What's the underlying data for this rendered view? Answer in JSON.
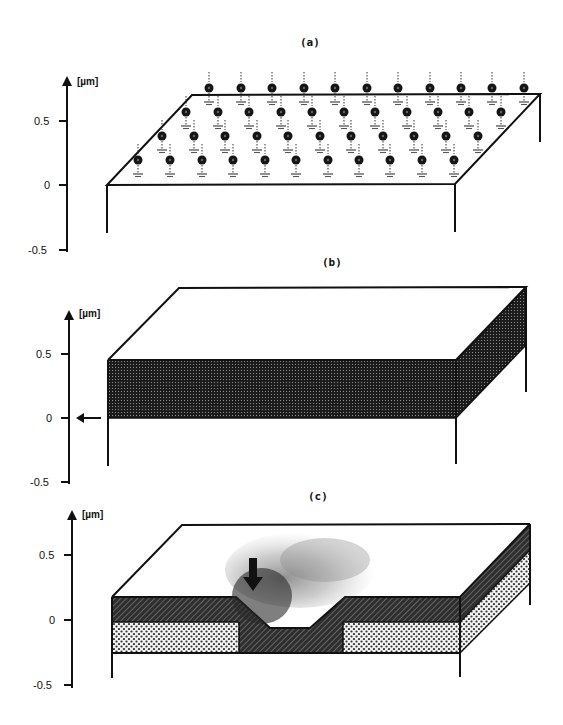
{
  "panels": [
    {
      "id": "a",
      "label": "(a)",
      "axis": {
        "unit": "[µm]",
        "ticks": [
          "0.5",
          "0",
          "-0.5"
        ]
      },
      "description": "Substrate surface with array of charged particles (dots) above dashed arrows toward ground-symbol charges on surface",
      "charge_rows": 4,
      "charges_per_row": 11
    },
    {
      "id": "b",
      "label": "(b)",
      "axis": {
        "unit": "[µm]",
        "ticks": [
          "0.5",
          "0",
          "-0.5"
        ]
      },
      "description": "Block with dark stippled layer from 0 to ~0.45 µm; arrow pointing at 0 level",
      "arrow": "left-arrow"
    },
    {
      "id": "c",
      "label": "(c)",
      "axis": {
        "unit": "[µm]",
        "ticks": [
          "0.5",
          "0",
          "-0.5"
        ]
      },
      "description": "Two-layer stack (hatched top, dotted bottom) with trapezoidal groove; downward arrow and particle spray at groove",
      "arrow": "down-arrow"
    }
  ],
  "colors": {
    "ink": "#111111",
    "background": "#ffffff",
    "dark_fill": "#2a2a2a",
    "hatch_fill": "#3a3a3a"
  }
}
